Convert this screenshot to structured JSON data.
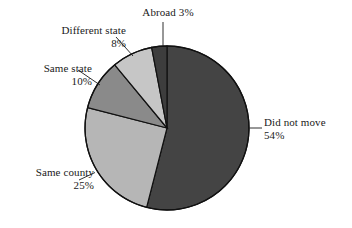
{
  "chart_data": {
    "type": "pie",
    "title": "",
    "subtitle": "",
    "xlabel": "",
    "ylabel": "",
    "legend_position": "none",
    "grid": false,
    "units": "percent",
    "start_angle_deg": 0,
    "direction": "clockwise",
    "categories": [
      "Did not move",
      "Same county",
      "Same state",
      "Different state",
      "Abroad"
    ],
    "values": [
      54,
      25,
      10,
      8,
      3
    ],
    "slices": [
      {
        "name": "did-not-move",
        "label": "Did not move",
        "value": 54,
        "value_text": "54%",
        "color": "#444444",
        "label_side": "right",
        "label_lines": [
          "Did not move",
          "54%"
        ]
      },
      {
        "name": "same-county",
        "label": "Same county",
        "value": 25,
        "value_text": "25%",
        "color": "#b6b6b6",
        "label_side": "left",
        "label_lines": [
          "Same county",
          "25%"
        ]
      },
      {
        "name": "same-state",
        "label": "Same state",
        "value": 10,
        "value_text": "10%",
        "color": "#8a8a8a",
        "label_side": "left",
        "label_lines": [
          "Same state",
          "10%"
        ]
      },
      {
        "name": "different-state",
        "label": "Different state",
        "value": 8,
        "value_text": "8%",
        "color": "#c6c6c6",
        "label_side": "left",
        "label_lines": [
          "Different state",
          "8%"
        ]
      },
      {
        "name": "abroad",
        "label": "Abroad",
        "value": 3,
        "value_text": "3%",
        "color": "#3d3d3d",
        "label_side": "top",
        "label_lines": [
          "Abroad 3%"
        ]
      }
    ],
    "labels": {
      "did_not_move_name": "Did not move",
      "did_not_move_pct": "54%",
      "same_county_name": "Same county",
      "same_county_pct": "25%",
      "same_state_name": "Same state",
      "same_state_pct": "10%",
      "different_state_name": "Different state",
      "different_state_pct": "8%",
      "abroad_combined": "Abroad 3%"
    },
    "geometry": {
      "center_x": 167,
      "center_y": 128,
      "radius": 82,
      "outline_color": "#111111",
      "outline_width": 1.2,
      "background": "#ffffff"
    }
  }
}
